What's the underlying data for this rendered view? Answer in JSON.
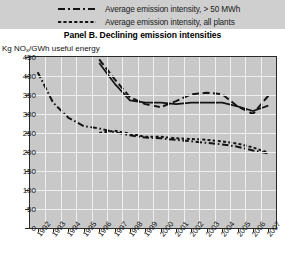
{
  "legend": {
    "items": [
      {
        "label": "Average emission intensity, > 50 MWh",
        "dash": "dash-dot",
        "key": "legend-key-dash-dot"
      },
      {
        "label": "Average emission intensity, all plants",
        "dash": "dotted",
        "key": "legend-key-dotted"
      }
    ]
  },
  "panel": {
    "title": "Panel B. Declining emission intensities"
  },
  "axis": {
    "unit_label_prefix": "Kg NO",
    "unit_label_sub": "x",
    "unit_label_suffix": "/GWh useful energy"
  },
  "chart_data": {
    "type": "line",
    "title": "Panel B. Declining emission intensities",
    "xlabel": "",
    "ylabel": "Kg NOx/GWh useful energy",
    "ylim": [
      0,
      450
    ],
    "yticks": [
      0,
      50,
      100,
      150,
      200,
      250,
      300,
      350,
      400,
      450
    ],
    "grid": true,
    "legend_position": "top",
    "categories": [
      "1992",
      "1993",
      "1994",
      "1995",
      "1996",
      "1997",
      "1998",
      "1999",
      "2000",
      "2001",
      "2002",
      "2003",
      "2004",
      "2005",
      "2006",
      "2007"
    ],
    "series": [
      {
        "name": "Average emission intensity, > 50 MWh",
        "style": "dash-dot",
        "color": "#141414",
        "values": [
          410,
          330,
          290,
          268,
          262,
          252,
          244,
          238,
          236,
          232,
          228,
          224,
          220,
          214,
          204,
          196
        ]
      },
      {
        "name": "Average emission intensity, all plants",
        "style": "dotted",
        "color": "#141414",
        "values": [
          null,
          null,
          null,
          null,
          250,
          256,
          248,
          240,
          240,
          236,
          234,
          232,
          228,
          222,
          212,
          198
        ]
      },
      {
        "name": "Upper solid series",
        "style": "solid",
        "color": "#141414",
        "values": [
          null,
          null,
          null,
          null,
          434,
          380,
          336,
          330,
          330,
          326,
          330,
          330,
          330,
          320,
          308,
          322
        ]
      },
      {
        "name": "Upper dashed series",
        "style": "dashed",
        "color": "#141414",
        "values": [
          null,
          null,
          null,
          null,
          444,
          392,
          344,
          326,
          318,
          334,
          352,
          356,
          352,
          320,
          300,
          348
        ]
      }
    ]
  }
}
